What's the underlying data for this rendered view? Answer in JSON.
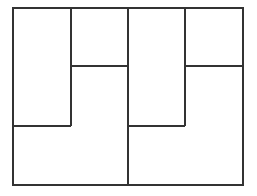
{
  "diagram": {
    "type": "rectangle-partition",
    "stroke_color": "#333333",
    "background": "#ffffff",
    "outer": {
      "x": 13,
      "y": 8,
      "width": 230,
      "height": 177
    },
    "segments": [
      {
        "id": "v1",
        "x1": 71,
        "y1": 8,
        "x2": 71,
        "y2": 126
      },
      {
        "id": "v2",
        "x1": 128,
        "y1": 8,
        "x2": 128,
        "y2": 185
      },
      {
        "id": "v3",
        "x1": 185,
        "y1": 8,
        "x2": 185,
        "y2": 126
      },
      {
        "id": "h1",
        "x1": 71,
        "y1": 66,
        "x2": 128,
        "y2": 66
      },
      {
        "id": "h2",
        "x1": 185,
        "y1": 66,
        "x2": 243,
        "y2": 66
      },
      {
        "id": "h3",
        "x1": 13,
        "y1": 126,
        "x2": 71,
        "y2": 126
      },
      {
        "id": "h4",
        "x1": 128,
        "y1": 126,
        "x2": 185,
        "y2": 126
      }
    ],
    "regions": [
      {
        "name": "left-tall-rectangle"
      },
      {
        "name": "left-top-square"
      },
      {
        "name": "left-l-shape"
      },
      {
        "name": "right-tall-rectangle"
      },
      {
        "name": "right-top-square"
      },
      {
        "name": "right-l-shape"
      }
    ]
  }
}
